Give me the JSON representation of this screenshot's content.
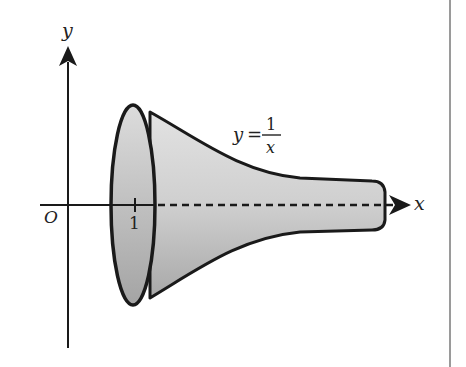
{
  "figure": {
    "axis_labels": {
      "x": "x",
      "y": "y",
      "origin": "O"
    },
    "tick_labels": {
      "x_one": "1"
    },
    "curve_label": {
      "lhs": "y",
      "equals": "=",
      "numerator": "1",
      "denominator": "x"
    },
    "colors": {
      "stroke": "#1a1a1a",
      "fill_light": "#d9d9d9",
      "fill_dark": "#a9a9a9",
      "border": "#9a9a9a"
    }
  }
}
